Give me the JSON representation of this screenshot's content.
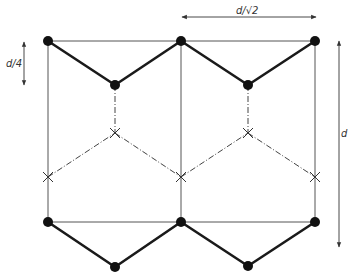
{
  "diagram": {
    "labels": {
      "quarter": "d/4",
      "width": "d/√2",
      "height": "d"
    },
    "colors": {
      "ink": "#1a1a1a",
      "thin_line": "#555555",
      "background": "#ffffff"
    },
    "nodes": {
      "atoms_top": [
        [
          48,
          41
        ],
        [
          181,
          41
        ],
        [
          315,
          41
        ]
      ],
      "atoms_top_lower": [
        [
          115,
          85
        ],
        [
          248,
          85
        ]
      ],
      "crosses_upper": [
        [
          115,
          133
        ],
        [
          248,
          133
        ]
      ],
      "crosses_lower": [
        [
          48,
          177
        ],
        [
          181,
          177
        ],
        [
          315,
          177
        ]
      ],
      "atoms_bottom": [
        [
          48,
          222
        ],
        [
          181,
          222
        ],
        [
          315,
          222
        ]
      ],
      "atoms_bottom_lower": [
        [
          115,
          267
        ],
        [
          248,
          266
        ]
      ]
    }
  }
}
